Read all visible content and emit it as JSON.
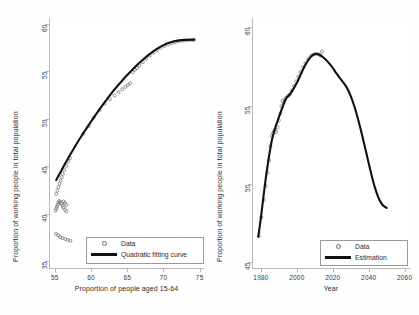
{
  "figure": {
    "background": "#ffffff",
    "curve_color": "#111111",
    "marker_color": "#6a6a6a",
    "axis_color": "#b9b9b9"
  },
  "chart_data": [
    {
      "type": "scatter",
      "panel": "left",
      "title": "",
      "xlabel": "Proportion of people aged 15-64",
      "ylabel": "Proportion of working people in total population",
      "xlim": [
        54.2,
        75.6
      ],
      "ylim": [
        34.3,
        60.6
      ],
      "xticks": [
        55,
        60,
        65,
        70,
        75
      ],
      "yticks": [
        35,
        40,
        45,
        50,
        55,
        60
      ],
      "grid": false,
      "legend_position": "bottom-right",
      "legend": [
        {
          "label": "Data",
          "marker": "circle"
        },
        {
          "label": "Quadratic fitting curve",
          "marker": "line"
        }
      ],
      "series": [
        {
          "name": "Data",
          "marker": "circle",
          "points": [
            [
              55.15,
              37.9
            ],
            [
              55.45,
              37.75
            ],
            [
              55.75,
              37.55
            ],
            [
              56.05,
              37.45
            ],
            [
              56.45,
              37.35
            ],
            [
              56.8,
              37.25
            ],
            [
              57.15,
              37.15
            ],
            [
              55.1,
              40.35
            ],
            [
              55.2,
              40.55
            ],
            [
              55.3,
              40.75
            ],
            [
              55.4,
              40.95
            ],
            [
              55.5,
              41.15
            ],
            [
              55.6,
              41.35
            ],
            [
              55.75,
              41.25
            ],
            [
              55.9,
              41.05
            ],
            [
              56.05,
              40.85
            ],
            [
              56.2,
              40.65
            ],
            [
              56.4,
              40.45
            ],
            [
              56.6,
              40.25
            ],
            [
              56.2,
              41.3
            ],
            [
              56.4,
              41.15
            ],
            [
              56.6,
              40.95
            ],
            [
              55.2,
              42.1
            ],
            [
              55.35,
              42.45
            ],
            [
              55.5,
              42.8
            ],
            [
              55.65,
              43.15
            ],
            [
              55.8,
              43.5
            ],
            [
              55.95,
              43.85
            ],
            [
              56.1,
              44.2
            ],
            [
              56.3,
              44.6
            ],
            [
              56.55,
              45.05
            ],
            [
              56.85,
              45.5
            ],
            [
              57.1,
              45.85
            ],
            [
              58.95,
              48.45
            ],
            [
              59.7,
              49.25
            ],
            [
              60.35,
              50.1
            ],
            [
              61.2,
              50.95
            ],
            [
              61.9,
              51.6
            ],
            [
              62.6,
              52.05
            ],
            [
              63.25,
              52.45
            ],
            [
              63.8,
              52.8
            ],
            [
              64.3,
              53.1
            ],
            [
              64.75,
              53.35
            ],
            [
              65.1,
              53.55
            ],
            [
              65.4,
              53.75
            ],
            [
              65.75,
              54.9
            ],
            [
              66.05,
              55.15
            ],
            [
              66.35,
              55.35
            ],
            [
              66.7,
              55.6
            ],
            [
              67.15,
              55.95
            ],
            [
              67.6,
              56.3
            ],
            [
              68.1,
              56.65
            ],
            [
              68.6,
              56.95
            ],
            [
              69.1,
              57.2
            ],
            [
              69.6,
              57.45
            ],
            [
              70.1,
              57.65
            ],
            [
              70.6,
              57.8
            ],
            [
              71.1,
              57.95
            ],
            [
              71.6,
              58.05
            ],
            [
              72.1,
              58.15
            ],
            [
              72.6,
              58.2
            ],
            [
              73.1,
              58.25
            ],
            [
              73.55,
              58.28
            ],
            [
              73.95,
              58.3
            ],
            [
              74.2,
              58.3
            ]
          ]
        },
        {
          "name": "Quadratic fitting curve",
          "marker": "line",
          "x": [
            55.2,
            56,
            57,
            58,
            59,
            60,
            61,
            62,
            63,
            64,
            65,
            66,
            67,
            68,
            69,
            70,
            71,
            72,
            73,
            74.25
          ],
          "y": [
            43.55,
            44.7,
            46.05,
            47.35,
            48.55,
            49.7,
            50.8,
            51.85,
            52.85,
            53.75,
            54.6,
            55.4,
            56.1,
            56.75,
            57.3,
            57.75,
            58.05,
            58.22,
            58.3,
            58.32
          ]
        }
      ]
    },
    {
      "type": "line",
      "panel": "right",
      "title": "",
      "xlabel": "Year",
      "ylabel": "Proportion of working people in total population",
      "xlim": [
        1975,
        2063
      ],
      "ylim": [
        44.6,
        60.6
      ],
      "xticks": [
        1980,
        2000,
        2020,
        2040,
        2060
      ],
      "yticks": [
        45,
        50,
        55,
        60
      ],
      "grid": false,
      "legend_position": "bottom-right",
      "legend": [
        {
          "label": "Data",
          "marker": "circle"
        },
        {
          "label": "Estimation",
          "marker": "line"
        }
      ],
      "series": [
        {
          "name": "Data",
          "marker": "circle",
          "points": [
            [
              1978.8,
              46.65
            ],
            [
              1980.2,
              47.85
            ],
            [
              1981.5,
              48.95
            ],
            [
              1982.6,
              49.85
            ],
            [
              1983.6,
              50.7
            ],
            [
              1984.5,
              51.5
            ],
            [
              1985.3,
              52.4
            ],
            [
              1986.0,
              53.05
            ],
            [
              1986.6,
              53.2
            ],
            [
              1987.2,
              53.35
            ],
            [
              1987.8,
              53.45
            ],
            [
              1988.4,
              53.3
            ],
            [
              1989.2,
              53.6
            ],
            [
              1990.0,
              54.05
            ],
            [
              1990.8,
              54.5
            ],
            [
              1991.4,
              54.95
            ],
            [
              1992.0,
              55.3
            ],
            [
              1992.6,
              55.15
            ],
            [
              1993.2,
              55.35
            ],
            [
              1994.0,
              55.5
            ],
            [
              1995.0,
              55.6
            ],
            [
              1996.0,
              55.7
            ],
            [
              1997.2,
              55.95
            ],
            [
              1998.4,
              56.25
            ],
            [
              1999.6,
              56.55
            ],
            [
              2000.8,
              56.85
            ],
            [
              2002.0,
              57.15
            ],
            [
              2003.4,
              57.45
            ],
            [
              2004.8,
              57.7
            ],
            [
              2006.2,
              57.95
            ],
            [
              2007.6,
              58.15
            ],
            [
              2009.0,
              58.25
            ],
            [
              2010.4,
              58.3
            ],
            [
              2011.8,
              58.28
            ],
            [
              2013.0,
              58.2
            ],
            [
              2014.0,
              58.45
            ]
          ]
        },
        {
          "name": "Estimation",
          "marker": "line",
          "x": [
            1978.5,
            1980,
            1982,
            1984,
            1986,
            1988,
            1990,
            1992,
            1994,
            1996,
            1998,
            2000,
            2002,
            2004,
            2006,
            2008,
            2010,
            2012,
            2014,
            2016,
            2018,
            2020,
            2022,
            2024,
            2026,
            2028,
            2030,
            2032,
            2034,
            2036,
            2038,
            2040,
            2042,
            2044,
            2046,
            2048,
            2050
          ],
          "y": [
            46.6,
            47.85,
            49.75,
            51.4,
            52.75,
            53.6,
            54.25,
            54.9,
            55.45,
            55.7,
            56.05,
            56.45,
            56.95,
            57.45,
            57.85,
            58.15,
            58.3,
            58.28,
            58.15,
            57.95,
            57.7,
            57.4,
            57.05,
            56.75,
            56.45,
            56.1,
            55.6,
            54.95,
            54.15,
            53.25,
            52.3,
            51.3,
            50.35,
            49.55,
            48.95,
            48.6,
            48.45
          ]
        }
      ]
    }
  ]
}
